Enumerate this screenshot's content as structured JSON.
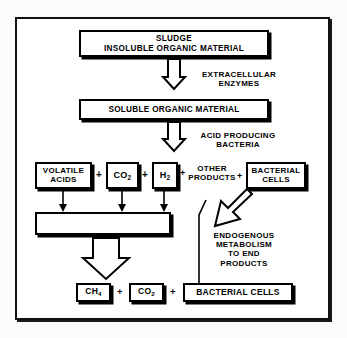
{
  "diagram": {
    "background_color": "#ffffff",
    "line_color": "#000000",
    "boxes": {
      "sludge": {
        "line1": "SLUDGE",
        "line2": "INSOLUBLE ORGANIC MATERIAL"
      },
      "soluble": {
        "line1": "SOLUBLE ORGANIC MATERIAL"
      },
      "volatile_acids": {
        "line1": "VOLATILE",
        "line2": "ACIDS"
      },
      "co2_mid": {
        "line1": "CO",
        "sub": "2"
      },
      "h2_mid": {
        "line1": "H",
        "sub": "2"
      },
      "bacterial_cells_mid": {
        "line1": "BACTERIAL",
        "line2": "CELLS"
      },
      "collector": {
        "line1": ""
      },
      "ch4_bottom": {
        "line1": "CH",
        "sub": "4"
      },
      "co2_bottom": {
        "line1": "CO",
        "sub": "2"
      },
      "bacterial_cells_bottom": {
        "line1": "BACTERIAL CELLS"
      }
    },
    "labels": {
      "extracellular_enzymes": {
        "line1": "EXTRACELLULAR",
        "line2": "ENZYMES"
      },
      "acid_producing_bacteria": {
        "line1": "ACID PRODUCING",
        "line2": "BACTERIA"
      },
      "other_products": {
        "line1": "OTHER",
        "line2": "PRODUCTS"
      },
      "endogenous_metabolism": {
        "line1": "ENDOGENOUS",
        "line2": "METABOLISM",
        "line3": "TO END",
        "line4": "PRODUCTS"
      }
    },
    "operators": {
      "plus_1": "+",
      "plus_2": "+",
      "plus_3": "+",
      "plus_4": "+",
      "plus_5": "+",
      "plus_6": "+"
    }
  }
}
